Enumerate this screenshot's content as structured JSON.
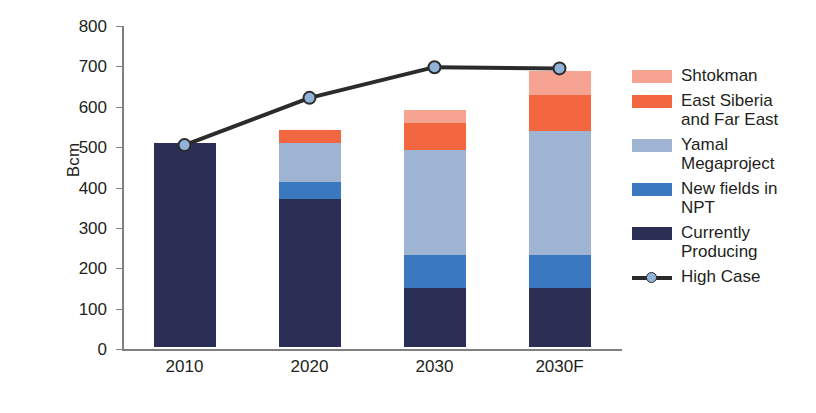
{
  "chart_data": {
    "type": "bar",
    "subtype": "stacked-bar-with-line-overlay",
    "title": "",
    "xlabel": "",
    "ylabel": "Bcm",
    "ylim": [
      0,
      800
    ],
    "ytick_values": [
      0,
      100,
      200,
      300,
      400,
      500,
      600,
      700,
      800
    ],
    "ytick_labels": [
      "0",
      "100",
      "200",
      "300",
      "400",
      "500",
      "600",
      "700",
      "800"
    ],
    "categories": [
      "2010",
      "2020",
      "2030",
      "2030F"
    ],
    "grid": false,
    "legend_position": "right",
    "series": [
      {
        "name": "Currently Producing",
        "color": "#2b2f55",
        "values": [
          505,
          366,
          146,
          146
        ]
      },
      {
        "name": "New fields in NPT",
        "color": "#3a78bf",
        "values": [
          0,
          42,
          82,
          82
        ]
      },
      {
        "name": "Yamal Megaproject",
        "color": "#9eb4d2",
        "values": [
          0,
          97,
          260,
          307
        ]
      },
      {
        "name": "East Siberia and Far East",
        "color": "#f2673f",
        "values": [
          0,
          32,
          66,
          89
        ]
      },
      {
        "name": "Shtokman",
        "color": "#f7a391",
        "values": [
          0,
          0,
          33,
          59
        ]
      }
    ],
    "stack_totals": [
      505,
      537,
      587,
      683
    ],
    "line_series": {
      "name": "High Case",
      "line_color": "#2b2b2b",
      "marker_color": "#8fb3d9",
      "values": [
        505,
        622,
        698,
        695
      ]
    }
  },
  "axis": {
    "y_title": "Bcm"
  },
  "legend": {
    "items": [
      {
        "label": "Shtokman",
        "swatch_color": "#f7a391",
        "type": "box"
      },
      {
        "label": "East Siberia\nand Far East",
        "swatch_color": "#f2673f",
        "type": "box"
      },
      {
        "label": "Yamal\nMegaproject",
        "swatch_color": "#9eb4d2",
        "type": "box"
      },
      {
        "label": "New fields in\nNPT",
        "swatch_color": "#3a78bf",
        "type": "box"
      },
      {
        "label": "Currently\nProducing",
        "swatch_color": "#2b2f55",
        "type": "box"
      },
      {
        "label": "High Case",
        "swatch_color": "#8fb3d9",
        "type": "line"
      }
    ]
  }
}
